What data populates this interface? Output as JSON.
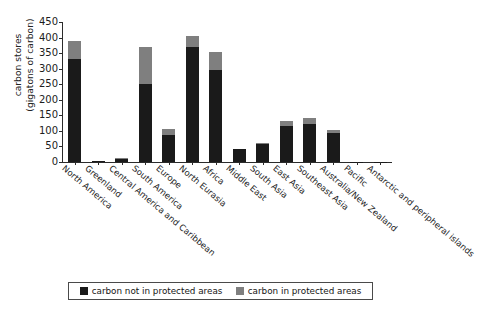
{
  "chart_data": {
    "type": "bar",
    "subtype": "stacked-bar",
    "title": "",
    "xlabel": "",
    "ylabel": "carbon stores\n(gigatons of carbon)",
    "ylim": [
      0,
      450
    ],
    "yticks": [
      0,
      50,
      100,
      150,
      200,
      250,
      300,
      350,
      400,
      450
    ],
    "grid": false,
    "legend_position": "bottom",
    "categories": [
      "North America",
      "Greenland",
      "Central America and Caribbean",
      "South America",
      "Europe",
      "North Eurasia",
      "Africa",
      "Middle East",
      "South Asia",
      "East Asia",
      "Southeast Asia",
      "Australia/New Zealand",
      "Pacific",
      "Antarctic and peripheral islands"
    ],
    "series": [
      {
        "name": "carbon not in protected areas",
        "color": "#1a1a1a",
        "values": [
          330,
          3,
          11,
          250,
          88,
          370,
          295,
          41,
          57,
          116,
          122,
          92,
          1,
          0.5
        ]
      },
      {
        "name": "carbon in protected areas",
        "color": "#7f7f7f",
        "values": [
          60,
          1,
          2,
          120,
          17,
          35,
          60,
          2,
          3,
          17,
          20,
          10,
          0.3,
          0.2
        ]
      }
    ],
    "totals": [
      390,
      4,
      13,
      370,
      105,
      405,
      355,
      43,
      60,
      133,
      142,
      102,
      1.3,
      0.7
    ]
  },
  "legend": {
    "items": [
      {
        "label": "carbon not in protected areas",
        "swatch": "#1a1a1a"
      },
      {
        "label": "carbon in protected areas",
        "swatch": "#7f7f7f"
      }
    ]
  },
  "axis": {
    "y_title": "carbon stores\n(gigatons of carbon)"
  }
}
